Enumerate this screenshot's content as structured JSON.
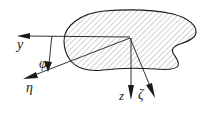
{
  "figure": {
    "type": "technical-diagram",
    "background_color": "#ffffff",
    "line_color": "#1a1a1a",
    "hatch_color": "#8c8c8c",
    "labels": {
      "y_axis": "y",
      "eta_axis": "η",
      "phi_angle": "φ",
      "z_axis": "z",
      "zeta_axis": "ζ"
    },
    "geometry": {
      "origin": {
        "x": 130,
        "y": 38
      },
      "y_axis_tip": {
        "x": 18,
        "y": 36
      },
      "eta_axis_tip": {
        "x": 24,
        "y": 79
      },
      "z_axis_tip": {
        "x": 132,
        "y": 99
      },
      "zeta_axis_tip": {
        "x": 155,
        "y": 97
      },
      "hatch_angle_deg": 45
    }
  }
}
